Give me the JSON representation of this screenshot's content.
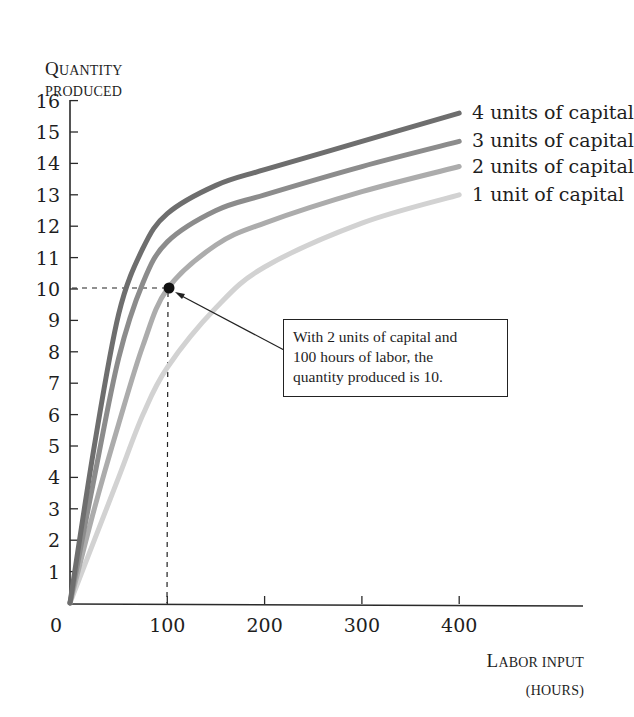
{
  "chart_data": {
    "type": "line",
    "title": "",
    "xlabel": "Labor input (hours)",
    "ylabel": "Quantity produced",
    "xlim": [
      0,
      520
    ],
    "ylim": [
      0,
      16
    ],
    "x_ticks": [
      0,
      100,
      200,
      300,
      400
    ],
    "y_ticks": [
      1,
      2,
      3,
      4,
      5,
      6,
      7,
      8,
      9,
      10,
      11,
      12,
      13,
      14,
      15,
      16
    ],
    "grid": false,
    "legend_position": "right-end labels",
    "series": [
      {
        "name": "4 units of capital",
        "color": "#6e6e6e",
        "x": [
          0,
          25,
          50,
          75,
          100,
          150,
          200,
          300,
          400
        ],
        "y": [
          0,
          5.0,
          9.2,
          11.3,
          12.4,
          13.3,
          13.8,
          14.7,
          15.6
        ]
      },
      {
        "name": "3 units of capital",
        "color": "#8c8c8c",
        "x": [
          0,
          25,
          50,
          75,
          100,
          150,
          200,
          300,
          400
        ],
        "y": [
          0,
          4.0,
          7.8,
          10.2,
          11.5,
          12.5,
          13.0,
          13.9,
          14.7
        ]
      },
      {
        "name": "2 units of capital",
        "color": "#acacac",
        "x": [
          0,
          25,
          50,
          75,
          100,
          150,
          200,
          300,
          400
        ],
        "y": [
          0,
          3.0,
          5.7,
          8.2,
          10.0,
          11.4,
          12.1,
          13.1,
          13.9
        ]
      },
      {
        "name": "1 unit of capital",
        "color": "#d2d2d2",
        "x": [
          0,
          25,
          50,
          75,
          100,
          150,
          200,
          300,
          400
        ],
        "y": [
          0,
          2.0,
          4.0,
          6.0,
          7.5,
          9.4,
          10.7,
          12.1,
          13.0
        ]
      }
    ],
    "highlight_point": {
      "x": 100,
      "y": 10,
      "series": "2 units of capital"
    },
    "annotations": [
      "With 2 units of capital and 100 hours of labor, the quantity produced is 10."
    ]
  },
  "axes": {
    "y_label_line1_cap": "Q",
    "y_label_line1_rest": "UANTITY",
    "y_label_line2": "PRODUCED",
    "x_label_line1_cap": "L",
    "x_label_line1_rest": "ABOR INPUT",
    "x_label_line2": "(HOURS)",
    "x_tick_labels": [
      "0",
      "100",
      "200",
      "300",
      "400"
    ],
    "y_tick_labels": [
      "1",
      "2",
      "3",
      "4",
      "5",
      "6",
      "7",
      "8",
      "9",
      "10",
      "11",
      "12",
      "13",
      "14",
      "15",
      "16"
    ]
  },
  "legend": {
    "s4": "4 units of capital",
    "s3": "3 units of capital",
    "s2": "2 units of capital",
    "s1": "1 unit of capital"
  },
  "annotation": {
    "line1": "With 2 units of capital and",
    "line2": "100 hours of labor, the",
    "line3": "quantity produced is 10."
  }
}
